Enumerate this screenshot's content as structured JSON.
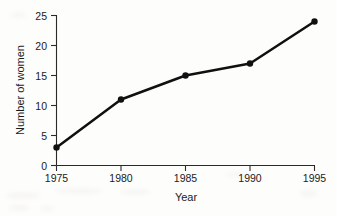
{
  "chart_data": {
    "type": "line",
    "title": "",
    "xlabel": "Year",
    "ylabel": "Number of women",
    "x": [
      1975,
      1980,
      1985,
      1990,
      1995
    ],
    "values": [
      3,
      11,
      15,
      17,
      24
    ],
    "xticklabels": [
      "1975",
      "1980",
      "1985",
      "1990",
      "1995"
    ],
    "yticklabels": [
      "0",
      "5",
      "10",
      "15",
      "20",
      "25"
    ],
    "yticks": [
      0,
      5,
      10,
      15,
      20,
      25
    ],
    "xlim": [
      1975,
      1995
    ],
    "ylim": [
      0,
      25
    ],
    "grid": false,
    "legend": false,
    "legend_position": "none",
    "marker": "filled-circle",
    "line_color": "#101010",
    "marker_color": "#101010",
    "background_color": "#fdfdfc",
    "axis_color": "#2a2a2a",
    "series": [
      {
        "name": "Number of women",
        "points": [
          {
            "x": "1975",
            "y": 3
          },
          {
            "x": "1980",
            "y": 11
          },
          {
            "x": "1985",
            "y": 15
          },
          {
            "x": "1990",
            "y": 17
          },
          {
            "x": "1995",
            "y": 24
          }
        ]
      }
    ]
  }
}
